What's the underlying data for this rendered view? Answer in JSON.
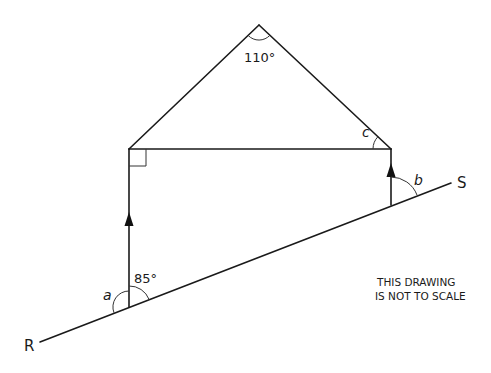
{
  "diagram": {
    "type": "geometry",
    "title": "",
    "labels": {
      "apex_angle": "110°",
      "angle_c": "c",
      "angle_a": "a",
      "angle_85": "85°",
      "angle_b": "b",
      "point_r": "R",
      "point_s": "S"
    },
    "note": {
      "line1": "THIS DRAWING",
      "line2": "IS NOT TO SCALE"
    },
    "colors": {
      "stroke": "#1a1a1a",
      "background": "#ffffff"
    },
    "points": {
      "apex": [
        259,
        25
      ],
      "top_left": [
        129,
        149
      ],
      "top_right": [
        391,
        149
      ],
      "bottom_left": [
        129,
        307
      ],
      "bottom_right": [
        391,
        205
      ],
      "line_start_R": [
        40,
        342
      ],
      "line_end_S": [
        451,
        183
      ]
    },
    "annotations": {
      "right_angle_marker": "top_left",
      "parallel_arrows": [
        "left_vertical",
        "right_vertical"
      ]
    }
  }
}
